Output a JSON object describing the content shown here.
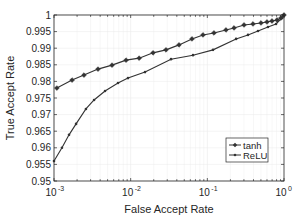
{
  "chart_data": {
    "type": "line",
    "title": "",
    "xlabel": "False Accept Rate",
    "ylabel": "True Accept Rate",
    "xscale": "log",
    "xlim": [
      0.001,
      1
    ],
    "ylim": [
      0.95,
      1
    ],
    "xticks": [
      0.001,
      0.01,
      0.1,
      1
    ],
    "xtick_labels": [
      {
        "base": "10",
        "exp": "-3"
      },
      {
        "base": "10",
        "exp": "-2"
      },
      {
        "base": "10",
        "exp": "-1"
      },
      {
        "base": "10",
        "exp": "0"
      }
    ],
    "yticks": [
      0.95,
      0.955,
      0.96,
      0.965,
      0.97,
      0.975,
      0.98,
      0.985,
      0.99,
      0.995,
      1
    ],
    "ytick_labels": [
      "0.95",
      "0.955",
      "0.96",
      "0.965",
      "0.97",
      "0.975",
      "0.98",
      "0.985",
      "0.99",
      "0.995",
      "1"
    ],
    "grid": true,
    "legend_position": "lower right",
    "series": [
      {
        "name": "tanh",
        "marker": "diamond",
        "color": "#333333",
        "x": [
          0.00109,
          0.00172,
          0.00246,
          0.00375,
          0.00571,
          0.0087,
          0.0129,
          0.0196,
          0.0289,
          0.0427,
          0.063,
          0.0877,
          0.122,
          0.175,
          0.223,
          0.301,
          0.394,
          0.501,
          0.6,
          0.697,
          0.811,
          0.914,
          1.0
        ],
        "y": [
          0.978,
          0.9804,
          0.9819,
          0.9837,
          0.9849,
          0.9864,
          0.987,
          0.9886,
          0.9895,
          0.991,
          0.9928,
          0.994,
          0.9946,
          0.9955,
          0.9961,
          0.997,
          0.9973,
          0.9976,
          0.9979,
          0.9982,
          0.9985,
          0.9991,
          1.0
        ]
      },
      {
        "name": "ReLU",
        "marker": "point",
        "color": "#333333",
        "x": [
          0.001,
          0.00127,
          0.00157,
          0.00194,
          0.00261,
          0.00333,
          0.00463,
          0.00684,
          0.00923,
          0.0154,
          0.0336,
          0.065,
          0.1187,
          0.237,
          0.339,
          0.458,
          0.618,
          0.787,
          0.942,
          1.0
        ],
        "y": [
          0.956,
          0.96,
          0.9639,
          0.9672,
          0.9717,
          0.9744,
          0.9771,
          0.9795,
          0.981,
          0.9828,
          0.9867,
          0.9879,
          0.9895,
          0.9928,
          0.994,
          0.9952,
          0.9964,
          0.9973,
          0.9991,
          1.0
        ]
      }
    ]
  },
  "legend": {
    "items": [
      {
        "label": "tanh",
        "marker": "diamond"
      },
      {
        "label": "ReLU",
        "marker": "point"
      }
    ]
  },
  "colors": {
    "axis": "#262626",
    "grid": "#ececec",
    "line": "#333333",
    "background": "#ffffff"
  }
}
